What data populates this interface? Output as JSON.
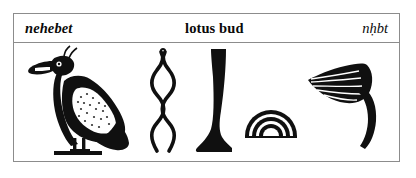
{
  "entry": {
    "transcription_label": "nehebet",
    "meaning_label": "lotus bud",
    "transliteration_label": "nḥbt"
  },
  "glyphs": [
    {
      "id": "vulture",
      "name": "egyptian-vulture-glyph",
      "phonetic": "3",
      "gardiner": "G1",
      "alt": "Egyptian vulture standing on a ground line"
    },
    {
      "id": "wick",
      "name": "twisted-flax-wick-glyph",
      "phonetic": "ḥ",
      "gardiner": "V28",
      "alt": "Twisted wick of flax"
    },
    {
      "id": "leg",
      "name": "leg-and-foot-glyph",
      "phonetic": "b",
      "gardiner": "D58",
      "alt": "Human lower leg and foot"
    },
    {
      "id": "loaf",
      "name": "bread-loaf-glyph",
      "phonetic": "t",
      "gardiner": "X1",
      "alt": "Semicircular loaf of bread with concentric arcs"
    },
    {
      "id": "bud",
      "name": "lotus-bud-glyph",
      "phonetic": "nḥb",
      "gardiner": "M9",
      "alt": "Lotus bud on a curved stem"
    }
  ],
  "colors": {
    "ink": "#101010",
    "frame": "#8c8c8c",
    "paper": "#ffffff"
  }
}
